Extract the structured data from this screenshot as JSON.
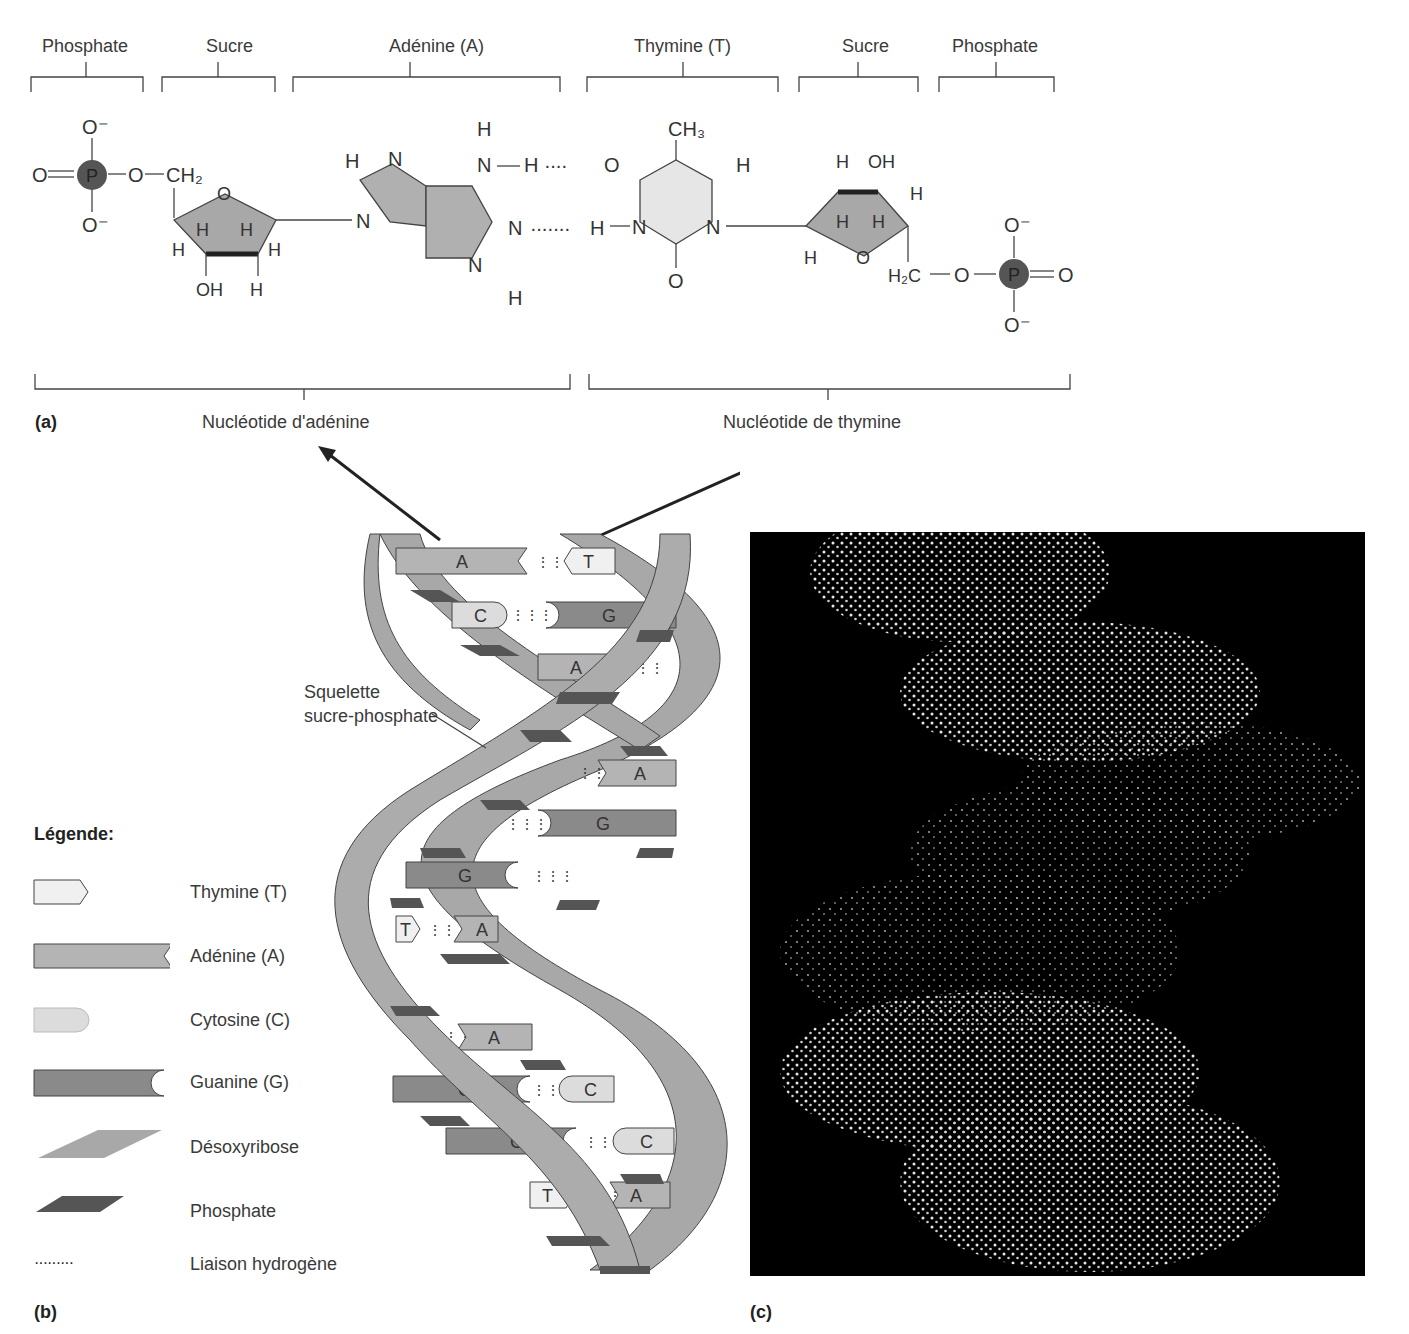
{
  "panel_a": {
    "tag": "(a)",
    "component_labels": [
      "Phosphate",
      "Sucre",
      "Adénine (A)",
      "Thymine (T)",
      "Sucre",
      "Phosphate"
    ],
    "nucleotide_labels": [
      "Nucléotide d'adénine",
      "Nucléotide de thymine"
    ],
    "atoms": {
      "O_minus": "O⁻",
      "O": "O",
      "P": "P",
      "CH2": "CH₂",
      "H2C": "H₂C",
      "CH3": "CH₃",
      "OH": "OH",
      "H": "H",
      "N": "N"
    }
  },
  "panel_b": {
    "tag": "(b)",
    "backbone_label_line1": "Squelette",
    "backbone_label_line2": "sucre-phosphate",
    "base_pairs": [
      {
        "left": "A",
        "right": "T"
      },
      {
        "left": "C",
        "right": "G"
      },
      {
        "left": "A",
        "right": "T"
      },
      {
        "left": "T",
        "right": "A"
      },
      {
        "left": "C",
        "right": "G"
      },
      {
        "left": "G",
        "right": "C"
      },
      {
        "left": "T",
        "right": "A"
      },
      {
        "left": "T",
        "right": "A"
      },
      {
        "left": "G",
        "right": "C"
      },
      {
        "left": "G",
        "right": "C"
      },
      {
        "left": "T",
        "right": "A"
      }
    ],
    "legend": {
      "title": "Légende:",
      "items": [
        {
          "label": "Thymine (T)",
          "shape": "thymine-shape"
        },
        {
          "label": "Adénine (A)",
          "shape": "adenine-shape"
        },
        {
          "label": "Cytosine (C)",
          "shape": "cytosine-shape"
        },
        {
          "label": "Guanine (G)",
          "shape": "guanine-shape"
        },
        {
          "label": "Désoxyribose",
          "shape": "deoxyribose-shape"
        },
        {
          "label": "Phosphate",
          "shape": "phosphate-shape"
        },
        {
          "label": "Liaison hydrogène",
          "shape": "hydrogen-bond-dots"
        }
      ]
    },
    "colors": {
      "thymine": "#f0f0f0",
      "adenine": "#b4b4b4",
      "cytosine": "#dcdcdc",
      "guanine": "#8a8a8a",
      "deoxyribose": "#a8a8a8",
      "phosphate": "#555555"
    }
  },
  "panel_c": {
    "tag": "(c)"
  }
}
